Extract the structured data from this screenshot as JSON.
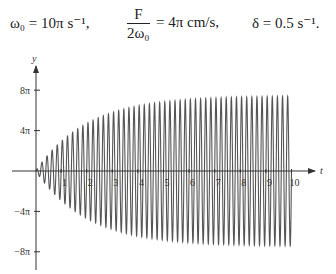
{
  "equations": {
    "omega": "ω₀ = 10π s⁻¹,",
    "frac_num": "F",
    "frac_den": "2ω₀",
    "frac_rhs": "= 4π cm/s,",
    "delta": "δ = 0.5 s⁻¹."
  },
  "chart_data": {
    "type": "line",
    "title": "",
    "xlabel": "t",
    "ylabel": "y",
    "x_ticks": [
      "1",
      "2",
      "3",
      "4",
      "5",
      "6",
      "7",
      "8",
      "9",
      "10"
    ],
    "y_ticks": [
      "8π",
      "4π",
      "−4π",
      "−8π"
    ],
    "xlim": [
      0,
      10.8
    ],
    "ylim": [
      -9.5,
      10.5
    ],
    "y_unit": "π",
    "grid": false,
    "legend": null,
    "series": [
      {
        "name": "y(t) = 8π(1 − e^(−0.5t)) sin(10πt)",
        "omega": 31.4159,
        "envelope_max_pi": 8,
        "delta": 0.5,
        "t_range": [
          0,
          10
        ],
        "cycles": 50
      }
    ],
    "envelope_samples": {
      "t": [
        0,
        1,
        2,
        3,
        4,
        5,
        6,
        7,
        8,
        9,
        10
      ],
      "amp_pi": [
        0,
        3.15,
        5.06,
        6.21,
        6.92,
        7.34,
        7.6,
        7.76,
        7.85,
        7.91,
        7.95
      ]
    }
  },
  "colors": {
    "line": "#555555",
    "axis": "#333333"
  }
}
